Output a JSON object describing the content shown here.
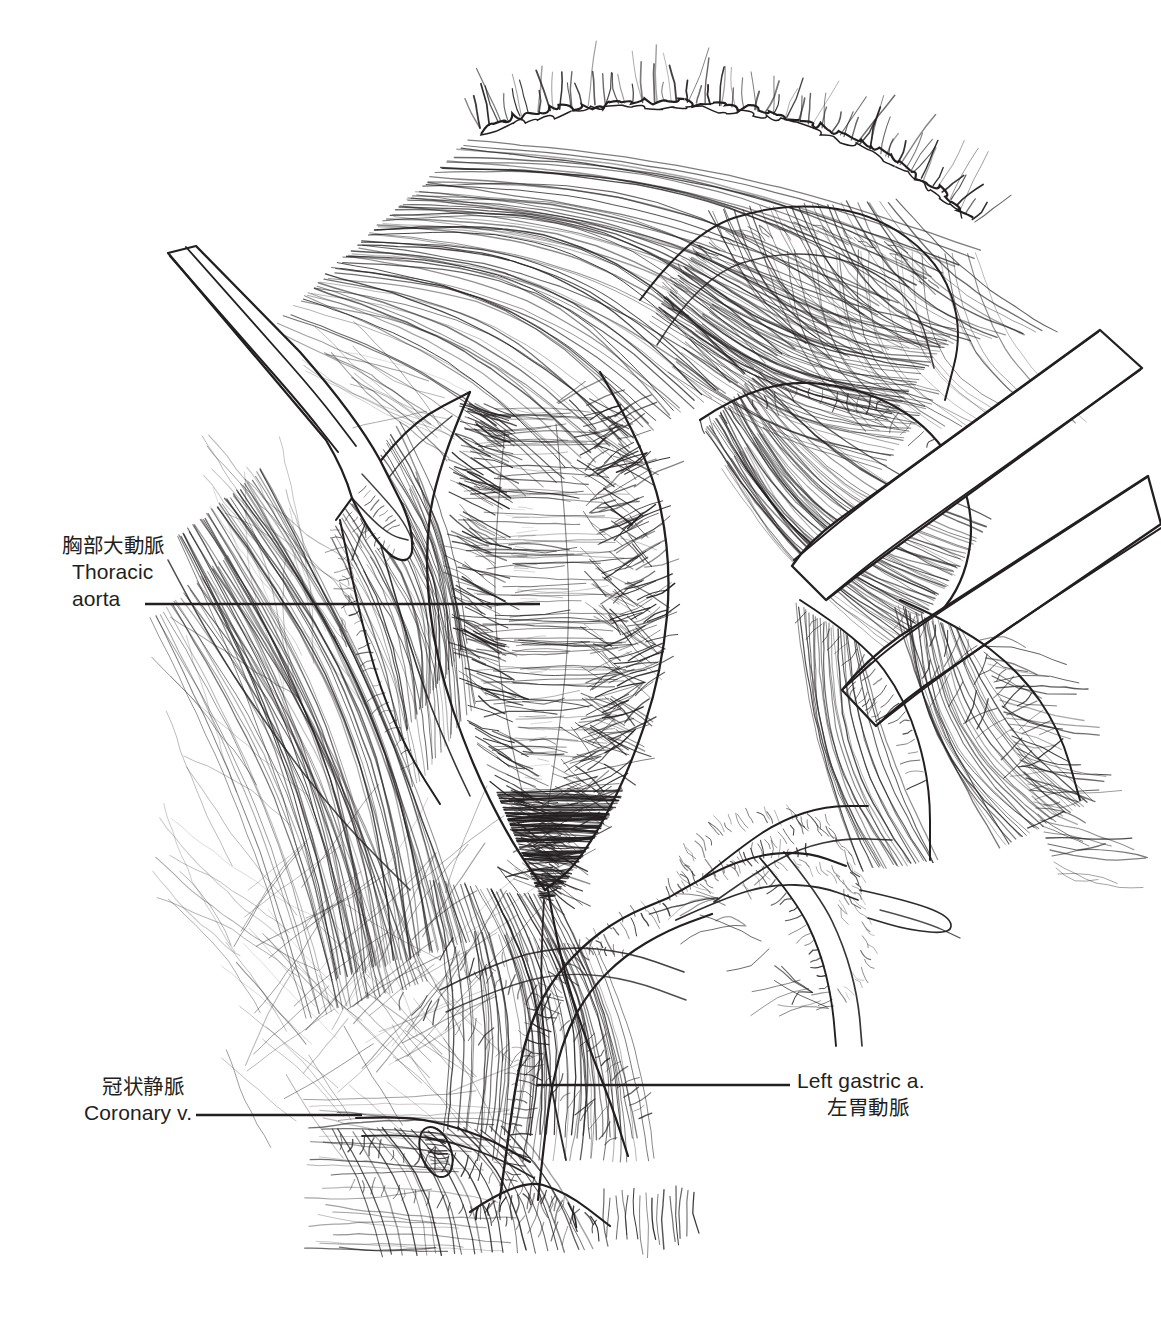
{
  "figure": {
    "kind": "surgical-anatomy-line-drawing",
    "technique": "pen-and-ink hatching",
    "ink_color": "#231f20",
    "background_color": "#ffffff",
    "width": 1161,
    "height": 1320
  },
  "labels": {
    "thoracic_aorta": {
      "jp": "胸部大動脈",
      "en_line1": "Thoracic",
      "en_line2": "aorta",
      "leader": {
        "x1": 145,
        "y1": 604,
        "x2": 540,
        "y2": 604
      }
    },
    "coronary_vein": {
      "jp": "冠状静脈",
      "en": "Coronary v.",
      "leader": {
        "x1": 196,
        "y1": 1115,
        "x2": 362,
        "y2": 1115
      }
    },
    "left_gastric_artery": {
      "en": "Left gastric a.",
      "jp": "左胃動脈",
      "leader": {
        "x1": 537,
        "y1": 1085,
        "x2": 790,
        "y2": 1085
      }
    }
  },
  "structures": [
    {
      "name": "diaphragm-cut-edge",
      "note": "wavy incised peritoneal edge across top"
    },
    {
      "name": "thoracic-aorta",
      "note": "central cross-hatched vessel, vertical"
    },
    {
      "name": "retractor-blade-left",
      "note": "smooth instrument entering upper left"
    },
    {
      "name": "retractor-blade-right-upper",
      "note": "instrument entering upper right"
    },
    {
      "name": "retractor-blade-right-lower",
      "note": "second instrument entering right"
    },
    {
      "name": "left-gastric-artery",
      "note": "vessel ascending from below center"
    },
    {
      "name": "coronary-vein",
      "note": "vessel at lower left of hiatus"
    },
    {
      "name": "vascular-plexus",
      "note": "branching vessels lower right"
    },
    {
      "name": "crural-muscle",
      "note": "striated muscle fibers flanking the hiatus"
    }
  ]
}
